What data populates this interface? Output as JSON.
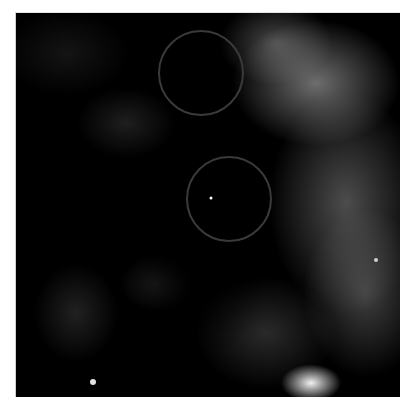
{
  "image": {
    "description": "Grayscale fluorescence microscopy field with speckled bright signal and two circled regions of interest",
    "frame": {
      "x": 15,
      "y": 12,
      "width": 384,
      "height": 384
    },
    "background_color": "#000000",
    "signal_color": "#ffffff"
  },
  "annotations": {
    "circles": [
      {
        "label": "roi-1",
        "cx": 201,
        "cy": 73,
        "r": 42,
        "stroke": "#3a3a3a"
      },
      {
        "label": "roi-2",
        "cx": 229,
        "cy": 199,
        "r": 42,
        "stroke": "#3a3a3a"
      }
    ]
  }
}
